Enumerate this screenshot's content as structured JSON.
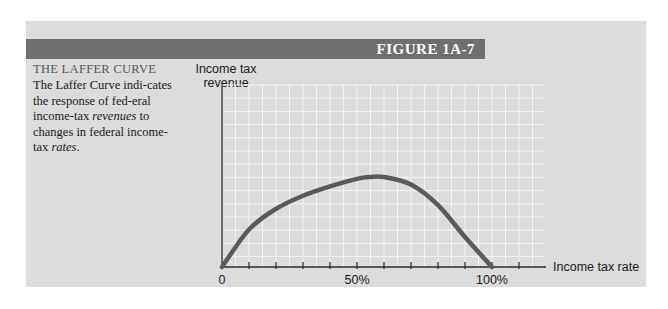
{
  "figure": {
    "label": "FIGURE 1A-7",
    "title": "THE LAFFER CURVE",
    "caption_parts": [
      {
        "text": "The Laffer Curve indi-cates the response of fed-eral income-tax ",
        "italic": false
      },
      {
        "text": "revenues",
        "italic": true
      },
      {
        "text": " to changes in federal income-tax ",
        "italic": false
      },
      {
        "text": "rates",
        "italic": true
      },
      {
        "text": ".",
        "italic": false
      }
    ]
  },
  "chart_data": {
    "type": "line",
    "title": "THE LAFFER CURVE",
    "xlabel": "Income tax rate",
    "ylabel": "Income tax revenue",
    "x_tick_labels": [
      "0",
      "50%",
      "100%"
    ],
    "x_tick_values": [
      0,
      50,
      100
    ],
    "x_minor_ticks_every": 10,
    "xlim": [
      0,
      120
    ],
    "ylim": [
      0,
      100
    ],
    "grid": true,
    "legend": null,
    "series": [
      {
        "name": "Laffer Curve",
        "x": [
          0,
          10,
          20,
          30,
          40,
          50,
          55,
          60,
          70,
          80,
          90,
          100
        ],
        "y": [
          0,
          20,
          31,
          38,
          43,
          47,
          48,
          48,
          44,
          33,
          16,
          0
        ]
      }
    ],
    "color": "#5a5a5a"
  },
  "labels": {
    "ylabel_line1": "Income tax",
    "ylabel_line2": "revenue",
    "xlabel": "Income tax rate",
    "tick0": "0",
    "tick50": "50%",
    "tick100": "100%"
  }
}
